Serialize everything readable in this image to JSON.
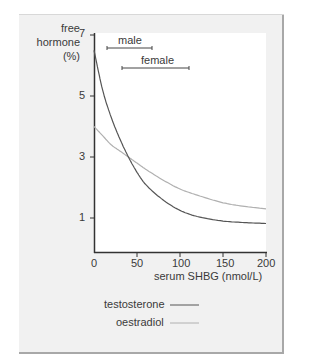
{
  "chart_data": {
    "type": "line",
    "title": "",
    "xlabel": "serum SHBG (nmol/L)",
    "ylabel": "free hormone (%)",
    "ylabel_lines": [
      "free",
      "hormone",
      "(%)"
    ],
    "xlim": [
      0,
      200
    ],
    "ylim": [
      0,
      7
    ],
    "xticks": [
      0,
      50,
      100,
      150,
      200
    ],
    "yticks": [
      1,
      3,
      5,
      7
    ],
    "grid": false,
    "legend_position": "bottom-left",
    "x": [
      0,
      10,
      20,
      30,
      40,
      50,
      60,
      80,
      100,
      120,
      150,
      175,
      200
    ],
    "series": [
      {
        "name": "testosterone",
        "color": "#555555",
        "values": [
          6.5,
          5.2,
          4.3,
          3.6,
          3.0,
          2.5,
          2.1,
          1.6,
          1.25,
          1.05,
          0.9,
          0.85,
          0.82
        ]
      },
      {
        "name": "oestradiol",
        "color": "#b0b0b0",
        "values": [
          4.0,
          3.7,
          3.4,
          3.2,
          3.0,
          2.8,
          2.6,
          2.25,
          1.95,
          1.75,
          1.5,
          1.38,
          1.3
        ]
      }
    ],
    "annotations": [
      {
        "label": "male",
        "type": "range",
        "x_start": 15,
        "x_end": 67
      },
      {
        "label": "female",
        "type": "range",
        "x_start": 32,
        "x_end": 110
      }
    ]
  },
  "legend": {
    "testosterone": "testosterone",
    "oestradiol": "oestradiol"
  },
  "ticks": {
    "x0": "0",
    "x50": "50",
    "x100": "100",
    "x150": "150",
    "x200": "200",
    "y1": "1",
    "y3": "3",
    "y5": "5",
    "y7": "7"
  },
  "labels": {
    "male": "male",
    "female": "female",
    "ylabel_1": "free",
    "ylabel_2": "hormone",
    "ylabel_3": "(%)",
    "xlabel": "serum SHBG (nmol/L)"
  }
}
